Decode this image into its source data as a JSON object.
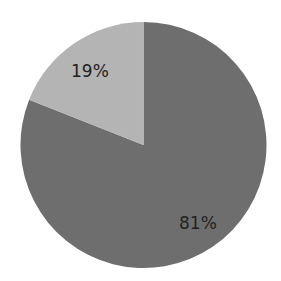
{
  "chart_data": {
    "type": "pie",
    "title": "",
    "categories": [
      "Segment A",
      "Segment B"
    ],
    "values": [
      81,
      19
    ],
    "labels": [
      "81%",
      "19%"
    ],
    "colors": [
      "#6e6e6e",
      "#b4b4b4"
    ],
    "start_angle_deg": 0,
    "direction": "clockwise",
    "legend": "none"
  },
  "labels": {
    "large_slice": "81%",
    "small_slice": "19%"
  },
  "colors": {
    "background": "#ffffff",
    "large_slice": "#6e6e6e",
    "small_slice": "#b4b4b4",
    "label_text": "#222222"
  }
}
